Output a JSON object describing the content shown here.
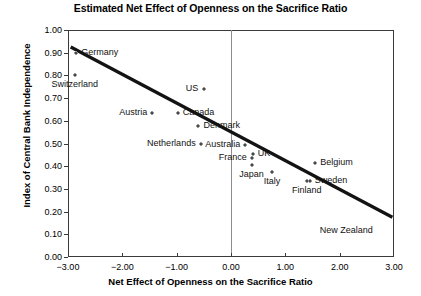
{
  "chart_data": {
    "type": "scatter",
    "title": "Estimated Net Effect of Openness on the Sacrifice Ratio",
    "xlabel": "Net Effect of Openness on the Sacrifice Ratio",
    "ylabel": "Index of Central Bank Independence",
    "xlim": [
      -3.0,
      3.0
    ],
    "ylim": [
      0.0,
      1.0
    ],
    "xticks": [
      "-3.00",
      "-2.00",
      "-1.00",
      "0.00",
      "1.00",
      "2.00",
      "3.00"
    ],
    "xtick_values": [
      -3.0,
      -2.0,
      -1.0,
      0.0,
      1.0,
      2.0,
      3.0
    ],
    "yticks": [
      "0.00",
      "0.10",
      "0.20",
      "0.30",
      "0.40",
      "0.50",
      "0.60",
      "0.70",
      "0.80",
      "0.90",
      "1.00"
    ],
    "ytick_values": [
      0.0,
      0.1,
      0.2,
      0.3,
      0.4,
      0.5,
      0.6,
      0.7,
      0.8,
      0.9,
      1.0
    ],
    "grid": false,
    "legend": "none",
    "zero_reference_line_x": 0.0,
    "points": [
      {
        "label": "Germany",
        "x": -2.85,
        "y": 0.9,
        "label_pos": "right",
        "has_marker": true
      },
      {
        "label": "Switzerland",
        "x": -2.87,
        "y": 0.8,
        "label_pos": "below",
        "has_marker": true
      },
      {
        "label": "US",
        "x": -0.5,
        "y": 0.74,
        "label_pos": "left",
        "has_marker": true
      },
      {
        "label": "Austria",
        "x": -1.45,
        "y": 0.635,
        "label_pos": "left",
        "has_marker": true
      },
      {
        "label": "Canada",
        "x": -0.98,
        "y": 0.635,
        "label_pos": "right",
        "has_marker": true
      },
      {
        "label": "Denmark",
        "x": -0.6,
        "y": 0.575,
        "label_pos": "right",
        "has_marker": true
      },
      {
        "label": "Netherlands",
        "x": -0.55,
        "y": 0.5,
        "label_pos": "left",
        "has_marker": true
      },
      {
        "label": "Australia",
        "x": 0.26,
        "y": 0.495,
        "label_pos": "left",
        "has_marker": true
      },
      {
        "label": "UK",
        "x": 0.4,
        "y": 0.455,
        "label_pos": "right",
        "has_marker": true
      },
      {
        "label": "France",
        "x": 0.38,
        "y": 0.435,
        "label_pos": "left",
        "has_marker": true
      },
      {
        "label": "Japan",
        "x": 0.38,
        "y": 0.405,
        "label_pos": "below",
        "has_marker": true
      },
      {
        "label": "Italy",
        "x": 0.76,
        "y": 0.375,
        "label_pos": "below",
        "has_marker": true
      },
      {
        "label": "Belgium",
        "x": 1.55,
        "y": 0.415,
        "label_pos": "right",
        "has_marker": true
      },
      {
        "label": "Sweden",
        "x": 1.45,
        "y": 0.335,
        "label_pos": "right",
        "has_marker": true
      },
      {
        "label": "Finland",
        "x": 1.4,
        "y": 0.335,
        "label_pos": "below",
        "has_marker": true
      },
      {
        "label": "New Zealand",
        "x": 2.7,
        "y": 0.115,
        "label_pos": "left",
        "has_marker": false
      }
    ],
    "trend_line": {
      "x0": -2.95,
      "y0": 0.925,
      "x1": 2.97,
      "y1": 0.175
    }
  }
}
